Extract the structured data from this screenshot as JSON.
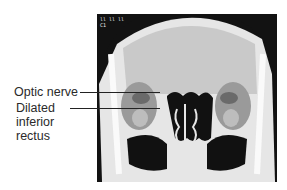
{
  "figure": {
    "type": "coronal CT scan of orbits",
    "scan_overlay_text": [
      "ll ll ll",
      "C1"
    ],
    "annotations": [
      {
        "id": "optic-nerve",
        "text": "Optic nerve"
      },
      {
        "id": "dilated-inferior-rectus",
        "text": "Dilated inferior rectus",
        "lines": [
          "Dilated",
          "inferior",
          "rectus"
        ]
      }
    ]
  }
}
